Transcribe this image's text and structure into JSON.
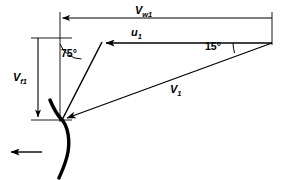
{
  "diagram": {
    "background_color": "#ffffff",
    "line_color": "#000000",
    "labels": {
      "whirl_velocity": {
        "symbol": "V",
        "subscript": "w1",
        "text": "Vw1"
      },
      "blade_velocity": {
        "symbol": "u",
        "subscript": "1",
        "text": "u1"
      },
      "flow_velocity": {
        "symbol": "V",
        "subscript": "f1",
        "text": "Vf1"
      },
      "absolute_velocity": {
        "symbol": "V",
        "subscript": "1",
        "text": "V1"
      },
      "blade_angle": "75°",
      "nozzle_angle": "15°"
    },
    "icons": {
      "flow_direction": "left-arrow-icon",
      "blade_profile": "blade-curve-icon"
    },
    "geometry": {
      "vertex": [
        62,
        120
      ],
      "right_apex": [
        272,
        43
      ],
      "u1_arrow_tip": [
        103,
        43
      ],
      "vw1_dimension_y": 18,
      "vw1_dimension_x_start": 60,
      "vw1_dimension_x_end": 272,
      "vf1_dimension_x": 38,
      "vf1_dimension_y_top": 38,
      "vf1_dimension_y_bottom": 120,
      "flow_arrow_y": 152,
      "flow_arrow_x_start": 42,
      "flow_arrow_x_end": 8
    }
  }
}
